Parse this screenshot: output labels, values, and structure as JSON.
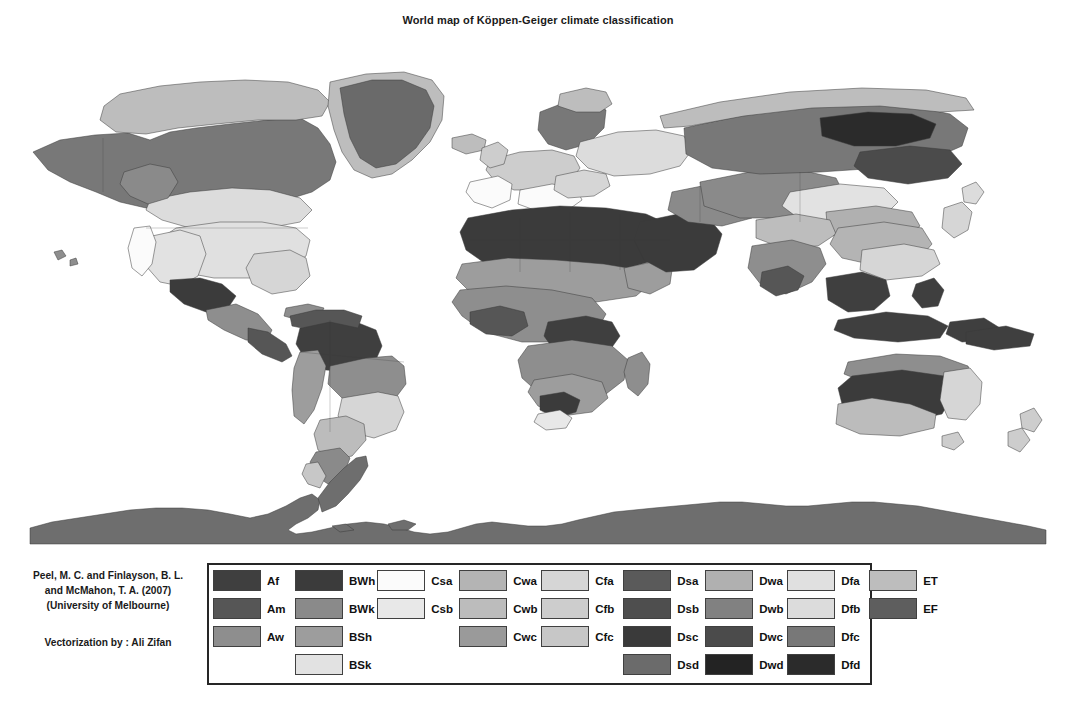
{
  "title": "World map of Köppen-Geiger climate classification",
  "attribution": {
    "reference_line1": "Peel, M. C. and Finlayson, B. L.",
    "reference_line2": "and McMahon, T. A. (2007)",
    "reference_line3": "(University of Melbourne)",
    "vectorization": "Vectorization by : Ali Zifan"
  },
  "legend": {
    "columns": [
      {
        "name": "group-A",
        "items": [
          {
            "label": "Af",
            "color": "#3f3f3f"
          },
          {
            "label": "Am",
            "color": "#565656"
          },
          {
            "label": "Aw",
            "color": "#8e8e8e"
          }
        ]
      },
      {
        "name": "group-B",
        "items": [
          {
            "label": "BWh",
            "color": "#3b3b3b"
          },
          {
            "label": "BWk",
            "color": "#8a8a8a"
          },
          {
            "label": "BSh",
            "color": "#9d9d9d"
          },
          {
            "label": "BSk",
            "color": "#e2e2e2"
          }
        ]
      },
      {
        "name": "group-Cs",
        "items": [
          {
            "label": "Csa",
            "color": "#fbfbfb"
          },
          {
            "label": "Csb",
            "color": "#e8e8e8"
          }
        ]
      },
      {
        "name": "group-Cw",
        "items": [
          {
            "label": "Cwa",
            "color": "#b4b4b4"
          },
          {
            "label": "Cwb",
            "color": "#bcbcbc"
          },
          {
            "label": "Cwc",
            "color": "#9a9a9a"
          }
        ]
      },
      {
        "name": "group-Cf",
        "items": [
          {
            "label": "Cfa",
            "color": "#d6d6d6"
          },
          {
            "label": "Cfb",
            "color": "#cdcdcd"
          },
          {
            "label": "Cfc",
            "color": "#c7c7c7"
          }
        ]
      },
      {
        "name": "group-Ds",
        "items": [
          {
            "label": "Dsa",
            "color": "#5a5a5a"
          },
          {
            "label": "Dsb",
            "color": "#4e4e4e"
          },
          {
            "label": "Dsc",
            "color": "#3a3a3a"
          },
          {
            "label": "Dsd",
            "color": "#6b6b6b"
          }
        ]
      },
      {
        "name": "group-Dw",
        "items": [
          {
            "label": "Dwa",
            "color": "#b0b0b0"
          },
          {
            "label": "Dwb",
            "color": "#818181"
          },
          {
            "label": "Dwc",
            "color": "#4b4b4b"
          },
          {
            "label": "Dwd",
            "color": "#232323"
          }
        ]
      },
      {
        "name": "group-Df",
        "items": [
          {
            "label": "Dfa",
            "color": "#e0e0e0"
          },
          {
            "label": "Dfb",
            "color": "#dcdcdc"
          },
          {
            "label": "Dfc",
            "color": "#787878"
          },
          {
            "label": "Dfd",
            "color": "#2b2b2b"
          }
        ]
      },
      {
        "name": "group-E",
        "items": [
          {
            "label": "ET",
            "color": "#bdbdbd"
          },
          {
            "label": "EF",
            "color": "#5e5e5e"
          }
        ]
      }
    ]
  },
  "map": {
    "ocean_color": "#ffffff",
    "outline_color": "#3a3a3a",
    "antarctica_color": "#6e6e6e",
    "greenland_color": "#6a6a6a"
  }
}
